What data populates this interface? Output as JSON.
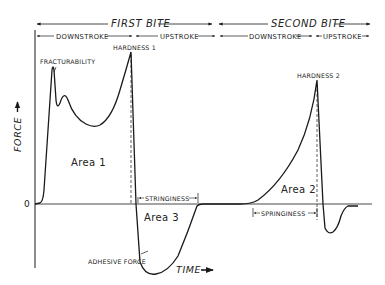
{
  "diagram": {
    "phases": {
      "first_bite": "FIRST BITE",
      "second_bite": "SECOND BITE"
    },
    "strokes": {
      "first_down": "DOWNSTROKE",
      "first_up": "UPSTROKE",
      "second_down": "DOWNSTROKE",
      "second_up": "UPSTROKE"
    },
    "annotations": {
      "fracturability": "FRACTURABILITY",
      "hardness1": "HARDNESS 1",
      "hardness2": "HARDNESS 2",
      "stringiness": "STRINGINESS",
      "springiness": "SPRINGINESS",
      "adhesive_force": "ADHESIVE FORCE"
    },
    "areas": {
      "area1": "Area 1",
      "area2": "Area 2",
      "area3": "Area 3"
    },
    "axes": {
      "y_label": "FORCE",
      "x_label": "TIME",
      "zero": "0"
    },
    "colors": {
      "line": "#1a1a1a",
      "background": "#ffffff"
    }
  }
}
